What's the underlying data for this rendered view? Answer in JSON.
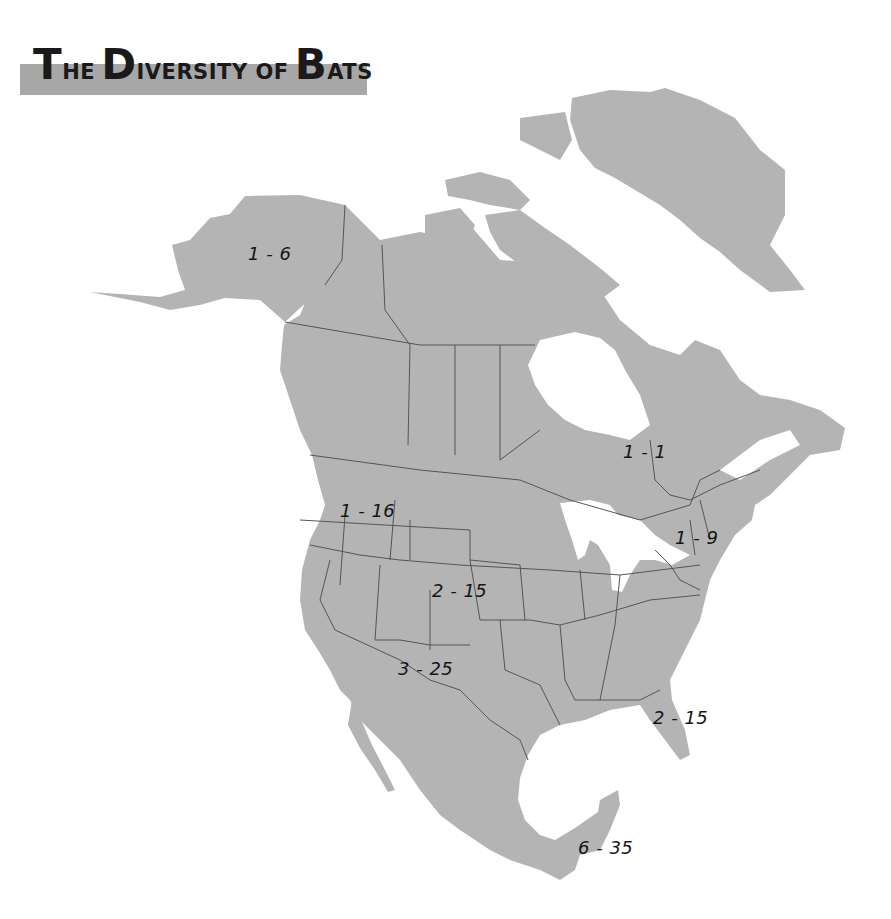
{
  "title": {
    "words": [
      {
        "cap": "T",
        "rest": "HE"
      },
      {
        "cap": "D",
        "rest": "IVERSITY OF"
      },
      {
        "cap": "B",
        "rest": "ATS"
      }
    ],
    "full_text": "The Diversity of Bats",
    "band_color": "#a7a7a7"
  },
  "map": {
    "region": "North America",
    "land_color": "#b4b4b4",
    "border_color": "#555555",
    "water_color": "#ffffff",
    "labels": [
      {
        "id": "alaska",
        "text": "1 - 6",
        "x": 248,
        "y": 243
      },
      {
        "id": "hudson-bay-quebec",
        "text": "1 - 1",
        "x": 623,
        "y": 441
      },
      {
        "id": "pacific-northwest",
        "text": "1 - 16",
        "x": 340,
        "y": 500
      },
      {
        "id": "northeast",
        "text": "1 - 9",
        "x": 675,
        "y": 527
      },
      {
        "id": "central-plains",
        "text": "2 - 15",
        "x": 432,
        "y": 580
      },
      {
        "id": "southwest",
        "text": "3 - 25",
        "x": 398,
        "y": 658
      },
      {
        "id": "florida",
        "text": "2 - 15",
        "x": 653,
        "y": 707
      },
      {
        "id": "southern-mexico",
        "text": "6 - 35",
        "x": 578,
        "y": 837
      }
    ]
  }
}
